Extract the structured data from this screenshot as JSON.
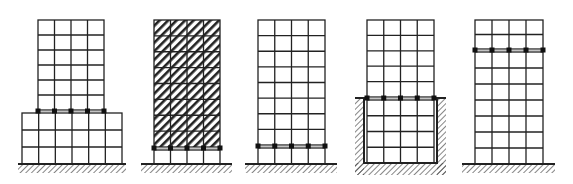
{
  "figure": {
    "colors": {
      "line": "#222222",
      "bearing": "#111111",
      "hatch": "#333333",
      "background": "#ffffff"
    }
  },
  "buildings": [
    {
      "id": "b1",
      "name": "isolation-on-podium",
      "hatched_infill": false,
      "tower": {
        "x": 38,
        "width": 66,
        "top": 20,
        "bottom": 110,
        "cols": 4,
        "rows": 6
      },
      "podium": {
        "x": 22,
        "width": 100,
        "top": 113,
        "bottom": 164,
        "cols": 6,
        "rows": 3
      },
      "isolation_y": 111,
      "ground": {
        "x1": 18,
        "x2": 126,
        "y": 164
      }
    },
    {
      "id": "b2",
      "name": "base-isolation-hatched",
      "hatched_infill": true,
      "tower": {
        "x": 154,
        "width": 66,
        "top": 20,
        "bottom": 147,
        "cols": 4,
        "rows": 8
      },
      "lower": {
        "top": 150,
        "bottom": 164,
        "rows": 1
      },
      "isolation_y": 148,
      "ground": {
        "x1": 141,
        "x2": 232,
        "y": 164
      }
    },
    {
      "id": "b3",
      "name": "base-isolation",
      "hatched_infill": false,
      "tower": {
        "x": 258,
        "width": 67,
        "top": 20,
        "bottom": 145,
        "cols": 4,
        "rows": 8
      },
      "lower": {
        "top": 148,
        "bottom": 164,
        "rows": 1
      },
      "isolation_y": 146,
      "ground": {
        "x1": 245,
        "x2": 337,
        "y": 164
      }
    },
    {
      "id": "b4",
      "name": "isolation-at-pit-top",
      "hatched_infill": false,
      "tower": {
        "x": 367,
        "width": 67,
        "top": 20,
        "bottom": 97,
        "cols": 4,
        "rows": 5
      },
      "lower": {
        "top": 100,
        "bottom": 163,
        "rows": 4
      },
      "isolation_y": 98,
      "pit": {
        "x1": 355,
        "x2": 446,
        "top": 98,
        "floor": 163,
        "wall": 9
      }
    },
    {
      "id": "b5",
      "name": "mid-storey-isolation",
      "hatched_infill": false,
      "tower": {
        "x": 475,
        "width": 68,
        "top": 20,
        "bottom": 49,
        "cols": 4,
        "rows": 2
      },
      "lower": {
        "top": 52,
        "bottom": 164,
        "rows": 7
      },
      "isolation_y": 50,
      "ground": {
        "x1": 462,
        "x2": 555,
        "y": 164
      }
    }
  ]
}
